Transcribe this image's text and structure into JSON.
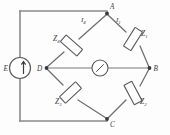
{
  "figure": {
    "kind": "circuit-diagram",
    "name": "ac-bridge-circuit"
  },
  "source": {
    "label": "E",
    "symbol": "source-circle-with-arrow"
  },
  "nodes": [
    {
      "id": "A",
      "label": "A",
      "position": "top"
    },
    {
      "id": "B",
      "label": "B",
      "position": "right"
    },
    {
      "id": "C",
      "label": "C",
      "position": "bottom"
    },
    {
      "id": "D",
      "label": "D",
      "position": "left"
    }
  ],
  "impedances": [
    {
      "id": "Z4",
      "base": "Z",
      "sub": "4",
      "branch": "A-D",
      "arm": "upper-left"
    },
    {
      "id": "Z1",
      "base": "Z",
      "sub": "1",
      "branch": "A-B",
      "arm": "upper-right"
    },
    {
      "id": "Z3",
      "base": "Z",
      "sub": "3",
      "branch": "D-C",
      "arm": "lower-left"
    },
    {
      "id": "Z2",
      "base": "Z",
      "sub": "2",
      "branch": "B-C",
      "arm": "lower-right"
    }
  ],
  "currents": [
    {
      "id": "I4",
      "base": "I",
      "sub": "4",
      "branch": "A-D",
      "arm": "upper-left"
    },
    {
      "id": "I1",
      "base": "I",
      "sub": "1",
      "branch": "A-B",
      "arm": "upper-right"
    }
  ],
  "detector": {
    "name": "galvanometer",
    "symbol": "circle-with-needle",
    "branch": "D-B"
  },
  "colors": {
    "wire": "#8a8a8a",
    "component_stroke": "#5a5a5a",
    "text": "#3a3a3a",
    "background": "#fdfdfd"
  }
}
